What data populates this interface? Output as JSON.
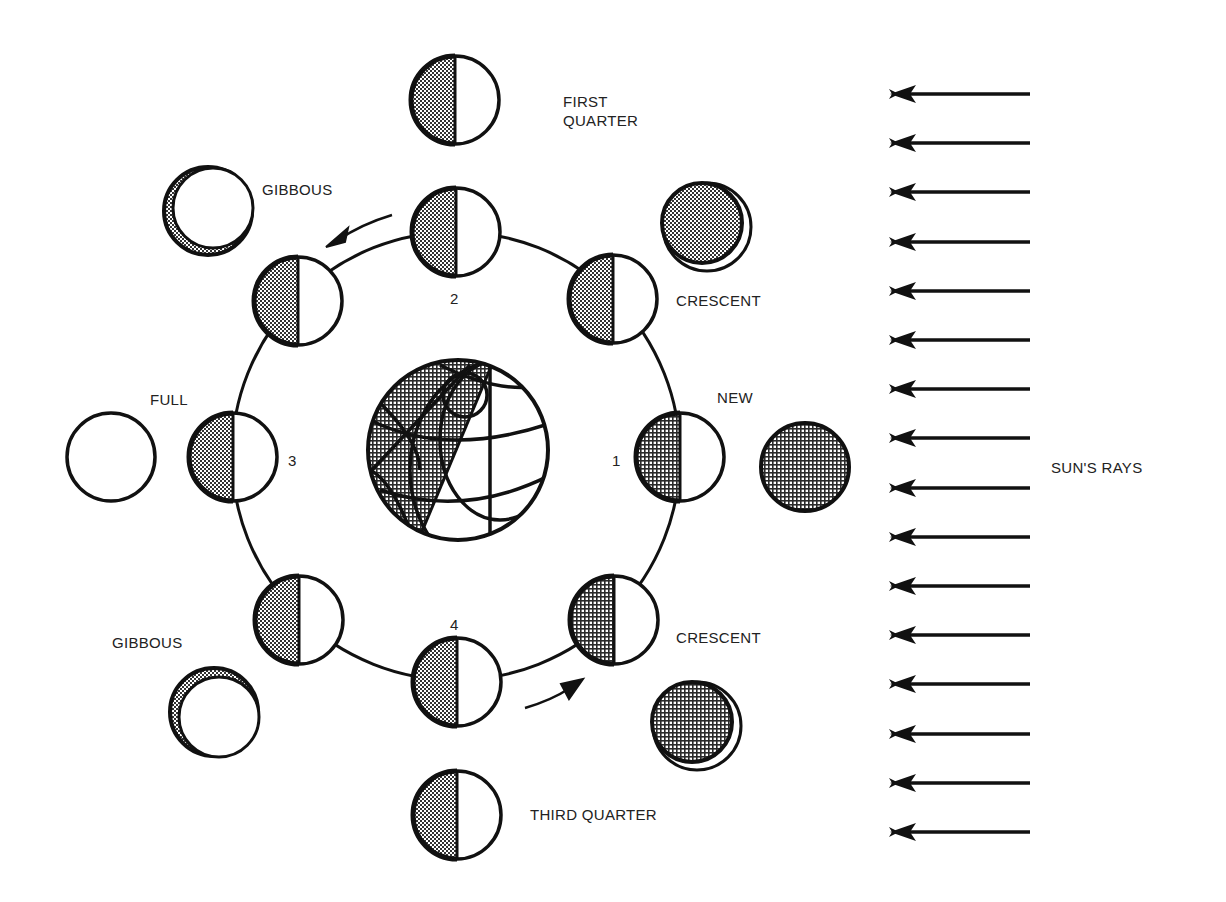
{
  "diagram": {
    "colors": {
      "ink": "#111111",
      "shade": "#8a8a8a",
      "paper": "#ffffff",
      "text": "#222222"
    },
    "labels": {
      "first_quarter": "FIRST\nQUARTER",
      "gibbous_top": "GIBBOUS",
      "crescent_top": "CRESCENT",
      "full": "FULL",
      "new": "NEW",
      "gibbous_bottom": "GIBBOUS",
      "crescent_bottom": "CRESCENT",
      "third_quarter": "THIRD QUARTER",
      "suns_rays": "SUN'S RAYS"
    },
    "position_numbers": {
      "p1": "1",
      "p2": "2",
      "p3": "3",
      "p4": "4"
    },
    "earth": {
      "name": "Earth",
      "center": [
        458,
        450
      ],
      "radius": 92
    },
    "orbit": {
      "center": [
        456,
        456
      ],
      "radius": 224
    },
    "orbit_moons": [
      {
        "id": "top",
        "cx": 456,
        "cy": 232
      },
      {
        "id": "upper-right",
        "cx": 613,
        "cy": 299
      },
      {
        "id": "right",
        "cx": 680,
        "cy": 457
      },
      {
        "id": "lower-right",
        "cx": 614,
        "cy": 620
      },
      {
        "id": "bottom",
        "cx": 457,
        "cy": 682
      },
      {
        "id": "lower-left",
        "cx": 299,
        "cy": 620
      },
      {
        "id": "left",
        "cx": 233,
        "cy": 457
      },
      {
        "id": "upper-left",
        "cx": 298,
        "cy": 301
      }
    ],
    "outer_moons": [
      {
        "id": "first-quarter",
        "phase": "half",
        "cx": 455,
        "cy": 100
      },
      {
        "id": "waxing-crescent-top",
        "phase": "crescent",
        "cx": 707,
        "cy": 227
      },
      {
        "id": "new",
        "phase": "new",
        "cx": 805,
        "cy": 467
      },
      {
        "id": "crescent-bottom",
        "phase": "crescent",
        "cx": 697,
        "cy": 726
      },
      {
        "id": "third-quarter",
        "phase": "half",
        "cx": 457,
        "cy": 815
      },
      {
        "id": "gibbous-bottom",
        "phase": "gibbous",
        "cx": 214,
        "cy": 712
      },
      {
        "id": "full",
        "phase": "full",
        "cx": 111,
        "cy": 457
      },
      {
        "id": "gibbous-top",
        "phase": "gibbous",
        "cx": 208,
        "cy": 211
      }
    ],
    "sun_rays": {
      "count": 16,
      "x_start": 1030,
      "x_end": 890,
      "y_first": 94,
      "y_step": 49.2
    }
  }
}
